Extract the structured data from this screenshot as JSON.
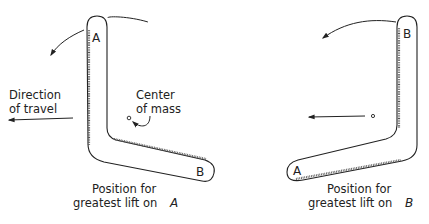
{
  "diagram": {
    "left_panel": {
      "tip_top_label": "A",
      "tip_end_label": "B",
      "direction_label_line1": "Direction",
      "direction_label_line2": "of travel",
      "center_label_line1": "Center",
      "center_label_line2": "of mass",
      "caption_line1": "Position for",
      "caption_line2": "greatest lift on",
      "caption_letter": "A"
    },
    "right_panel": {
      "tip_top_label": "B",
      "tip_end_label": "A",
      "caption_line1": "Position for",
      "caption_line2": "greatest lift on",
      "caption_letter": "B"
    },
    "colors": {
      "line": "#222222",
      "background": "#ffffff"
    }
  }
}
